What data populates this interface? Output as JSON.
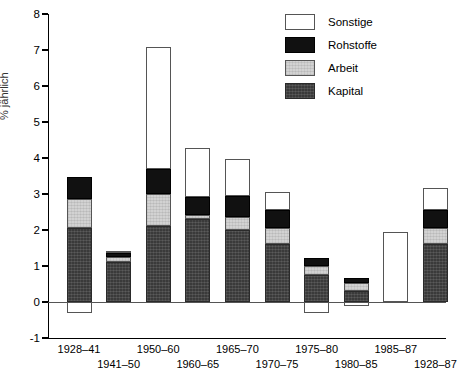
{
  "chart_data": {
    "type": "bar",
    "subtype": "stacked-bar",
    "title": "",
    "xlabel": "",
    "ylabel": "% jährlich",
    "ylim": [
      -1,
      8
    ],
    "yticks": [
      -1,
      0,
      1,
      2,
      3,
      4,
      5,
      6,
      7,
      8
    ],
    "ytick_labels": [
      "-1",
      "0",
      "1",
      "2",
      "3",
      "4",
      "5",
      "6",
      "7",
      "8"
    ],
    "grid": false,
    "legend_position": "top-right",
    "categories": [
      "1928–41",
      "1941–50",
      "1950–60",
      "1960–65",
      "1965–70",
      "1970–75",
      "1975–80",
      "1980–85",
      "1985–87",
      "1928–87"
    ],
    "series": [
      {
        "name": "Kapital",
        "color": "#3a3a3a",
        "values": [
          2.05,
          1.1,
          2.1,
          2.3,
          2.0,
          1.62,
          0.75,
          0.3,
          0.0,
          1.6
        ]
      },
      {
        "name": "Arbeit",
        "color": "#d2d2d2",
        "values": [
          0.8,
          0.15,
          0.9,
          0.12,
          0.35,
          0.43,
          0.25,
          0.22,
          0.0,
          0.45
        ]
      },
      {
        "name": "Rohstoffe",
        "color": "#111111",
        "values": [
          0.62,
          0.12,
          0.7,
          0.5,
          0.6,
          0.5,
          0.22,
          0.15,
          0.0,
          0.5
        ]
      },
      {
        "name": "Sonstige",
        "color": "#ffffff",
        "values": [
          -0.3,
          0.05,
          3.38,
          1.36,
          1.02,
          0.5,
          -0.3,
          -0.1,
          1.95,
          0.62
        ]
      }
    ],
    "totals": [
      3.47,
      1.42,
      7.08,
      4.28,
      3.97,
      3.05,
      1.22,
      0.67,
      1.95,
      3.17
    ]
  },
  "legend": {
    "items": [
      {
        "label": "Sonstige",
        "swatch": "sonstige"
      },
      {
        "label": "Rohstoffe",
        "swatch": "rohstoffe"
      },
      {
        "label": "Arbeit",
        "swatch": "arbeit"
      },
      {
        "label": "Kapital",
        "swatch": "kapital"
      }
    ]
  },
  "axis": {
    "y_title": "% jährlich",
    "y_labels": [
      "8",
      "7",
      "6",
      "5",
      "4",
      "3",
      "2",
      "1",
      "0",
      "-1"
    ],
    "x_labels_row1": [
      "1928–41",
      "1950–60",
      "1965–70",
      "1975–80",
      "1985–87"
    ],
    "x_labels_row2": [
      "1941–50",
      "1960–65",
      "1970–75",
      "1980–85",
      "1928–87"
    ]
  }
}
